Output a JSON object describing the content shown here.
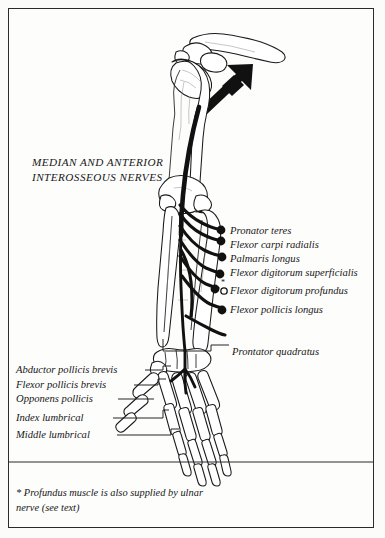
{
  "plate": {
    "title_line1": "MEDIAN AND ANTERIOR",
    "title_line2": "INTEROSSEOUS NERVES",
    "background_color": "#fdfdfc",
    "ink_color": "#171717",
    "border_color": "#2b2b2b"
  },
  "nerve_branch_labels": [
    {
      "label": "Pronator teres",
      "marker": "filled-dot"
    },
    {
      "label": "Flexor carpi radialis",
      "marker": "filled-dot"
    },
    {
      "label": "Palmaris longus",
      "marker": "filled-dot"
    },
    {
      "label": "Flexor digitorum superficialis",
      "marker": "filled-dot"
    },
    {
      "label": "Flexor digitorum profundus",
      "marker": "open-dot-asterisk"
    },
    {
      "label": "Flexor pollicis longus",
      "marker": "filled-dot"
    }
  ],
  "distal_label": {
    "label": "Prontator quadratus"
  },
  "hand_labels": [
    {
      "label": "Abductor pollicis brevis"
    },
    {
      "label": "Flexor pollicis brevis"
    },
    {
      "label": "Opponens pollicis"
    },
    {
      "label": "Index lumbrical"
    },
    {
      "label": "Middle lumbrical"
    }
  ],
  "footnote": {
    "line1": "* Profundus muscle is also supplied by ulnar",
    "line2": "nerve (see text)"
  },
  "figure": {
    "arrow_name": "median-nerve-origin-arrow",
    "skeleton_name": "upper-limb-skeleton",
    "nerve_name": "median-nerve-trunk"
  }
}
